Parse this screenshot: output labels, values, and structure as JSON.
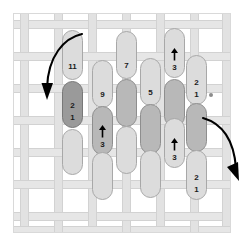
{
  "figure": {
    "title": "",
    "background_color": "#ffffff",
    "frame_color": "#d9d9d9",
    "weave_color": "#e4e4e4",
    "palette": {
      "light_pill": "#dcdcdc",
      "mid_pill": "#b8b8b8",
      "dark_pill": "#9a9a9a",
      "label_text": "#1a1a1a",
      "arrow": "#000000",
      "dot": "#8c8c8c"
    }
  },
  "columns": [
    {
      "name": "column-1",
      "x": 62,
      "width": 21,
      "pills": [
        {
          "name": "pill-c1-r1",
          "shade": "light",
          "top": 30,
          "height": 50,
          "labels": [
            "11"
          ],
          "arrow": false
        },
        {
          "name": "pill-c1-r2",
          "shade": "dark",
          "top": 81,
          "height": 47,
          "labels": [
            "2",
            "1"
          ],
          "arrow": false
        },
        {
          "name": "pill-c1-r3",
          "shade": "light",
          "top": 129,
          "height": 46,
          "labels": [],
          "arrow": false
        }
      ]
    },
    {
      "name": "column-2",
      "x": 92,
      "width": 21,
      "pills": [
        {
          "name": "pill-c2-r1",
          "shade": "light",
          "top": 60,
          "height": 48,
          "labels": [
            "9"
          ],
          "arrow": false
        },
        {
          "name": "pill-c2-r2",
          "shade": "mid",
          "top": 106,
          "height": 49,
          "labels": [
            "3"
          ],
          "arrow": true
        },
        {
          "name": "pill-c2-r3",
          "shade": "light",
          "top": 152,
          "height": 48,
          "labels": [],
          "arrow": false
        }
      ]
    },
    {
      "name": "column-3",
      "x": 116,
      "width": 21,
      "pills": [
        {
          "name": "pill-c3-r1",
          "shade": "light",
          "top": 31,
          "height": 48,
          "labels": [
            "7"
          ],
          "arrow": false
        },
        {
          "name": "pill-c3-r2",
          "shade": "mid",
          "top": 79,
          "height": 48,
          "labels": [],
          "arrow": false
        },
        {
          "name": "pill-c3-r3",
          "shade": "light",
          "top": 126,
          "height": 48,
          "labels": [],
          "arrow": false
        }
      ]
    },
    {
      "name": "column-4",
      "x": 140,
      "width": 21,
      "pills": [
        {
          "name": "pill-c4-r1",
          "shade": "light",
          "top": 58,
          "height": 48,
          "labels": [
            "5"
          ],
          "arrow": false
        },
        {
          "name": "pill-c4-r2",
          "shade": "mid",
          "top": 104,
          "height": 50,
          "labels": [],
          "arrow": false
        },
        {
          "name": "pill-c4-r3",
          "shade": "light",
          "top": 150,
          "height": 48,
          "labels": [],
          "arrow": false
        }
      ]
    },
    {
      "name": "column-5",
      "x": 164,
      "width": 21,
      "pills": [
        {
          "name": "pill-c5-r1",
          "shade": "light",
          "top": 28,
          "height": 50,
          "labels": [
            "3"
          ],
          "arrow": true
        },
        {
          "name": "pill-c5-r2",
          "shade": "mid",
          "top": 79,
          "height": 48,
          "labels": [],
          "arrow": false
        },
        {
          "name": "pill-c5-r3",
          "shade": "light",
          "top": 118,
          "height": 50,
          "labels": [
            "3"
          ],
          "arrow": true
        }
      ]
    },
    {
      "name": "column-6",
      "x": 186,
      "width": 21,
      "pills": [
        {
          "name": "pill-c6-r1",
          "shade": "light",
          "top": 55,
          "height": 50,
          "labels": [
            "2",
            "1"
          ],
          "arrow": false
        },
        {
          "name": "pill-c6-r2",
          "shade": "mid",
          "top": 103,
          "height": 49,
          "labels": [],
          "arrow": false
        },
        {
          "name": "pill-c6-r3",
          "shade": "light",
          "top": 150,
          "height": 50,
          "labels": [
            "2",
            "1"
          ],
          "arrow": false
        }
      ]
    }
  ],
  "annotations": [
    {
      "name": "curved-arrow-left",
      "label": "",
      "description": "curved arrow sweeping down-left into column 1"
    },
    {
      "name": "curved-arrow-right",
      "label": "",
      "description": "curved arrow sweeping down-right out of column 6"
    },
    {
      "name": "reference-dot",
      "label": "",
      "x": 209,
      "y": 93
    }
  ],
  "weave": {
    "vertical_positions": [
      6,
      40,
      74,
      108,
      142,
      176,
      208
    ],
    "horizontal_positions": [
      6,
      38,
      70,
      102,
      134,
      166,
      198,
      212
    ]
  }
}
